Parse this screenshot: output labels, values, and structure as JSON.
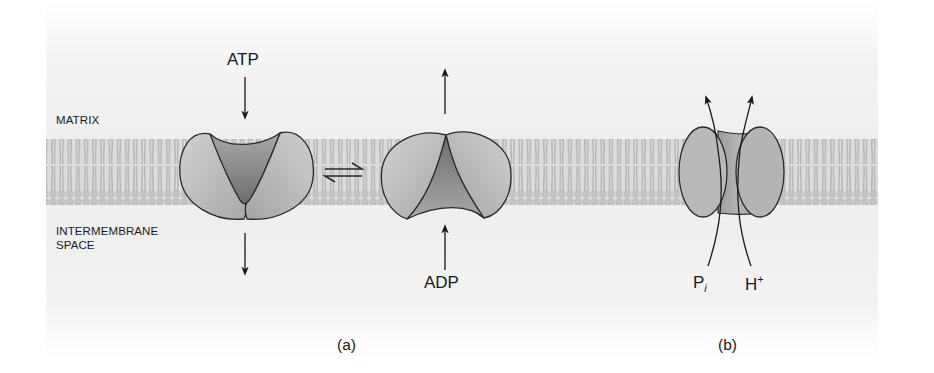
{
  "labels": {
    "matrix": "MATRIX",
    "intermembrane_line1": "INTERMEMBRANE",
    "intermembrane_line2": "SPACE",
    "atp": "ATP",
    "adp": "ADP",
    "pi_base": "P",
    "pi_sub": "i",
    "h_base": "H",
    "h_sup": "+",
    "caption_a": "(a)",
    "caption_b": "(b)"
  },
  "panels": [
    {
      "id": "a",
      "description": "ATP/ADP translocase: open to matrix binding ATP ⇌ open to intermembrane space binding ADP",
      "symbol": "⇌"
    },
    {
      "id": "b",
      "description": "Phosphate/H+ symporter moving Pi and H+ from intermembrane space into matrix"
    }
  ],
  "colors": {
    "background": "#efefef",
    "membrane": "#bdbdbd",
    "protein_light": "#c9c9c9",
    "protein_dark": "#7d7d7d",
    "outline": "#2a2a2a"
  }
}
